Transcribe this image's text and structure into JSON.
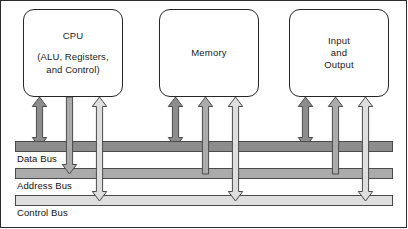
{
  "diagram": {
    "frame": {
      "width": 408,
      "height": 229
    }
  },
  "units": [
    {
      "id": "cpu",
      "title": "CPU",
      "subtitle_lines": [
        "(ALU, Registers,",
        "and Control)"
      ],
      "x": 22,
      "y": 8,
      "w": 100,
      "h": 88
    },
    {
      "id": "memory",
      "title": "Memory",
      "subtitle_lines": [],
      "x": 158,
      "y": 8,
      "w": 100,
      "h": 88
    },
    {
      "id": "input-output",
      "title": "Input\nand\nOutput",
      "title_lines": [
        "Input",
        "and",
        "Output"
      ],
      "subtitle_lines": [],
      "x": 288,
      "y": 8,
      "w": 100,
      "h": 88
    }
  ],
  "buses": [
    {
      "id": "data-bus",
      "label": "Data Bus",
      "x": 14,
      "y": 140,
      "w": 378,
      "h": 11,
      "color": "#8d8d8d",
      "label_x": 16,
      "label_y": 152
    },
    {
      "id": "address-bus",
      "label": "Address Bus",
      "x": 14,
      "y": 167,
      "w": 378,
      "h": 11,
      "color": "#ababab",
      "label_x": 16,
      "label_y": 179
    },
    {
      "id": "control-bus",
      "label": "Control Bus",
      "x": 14,
      "y": 194,
      "w": 378,
      "h": 11,
      "color": "#dedede",
      "label_x": 16,
      "label_y": 206
    }
  ],
  "colors": {
    "arrow_dark": "#8d8d8d",
    "arrow_mid": "#ababab",
    "arrow_light": "#dedede",
    "outline": "#4a4a4a",
    "box_border": "#262626",
    "text": "#1a1a1a",
    "background": "#ffffff"
  },
  "connections": [
    {
      "unit": "cpu",
      "bus": "data-bus",
      "style": "double",
      "shade": "dark",
      "x": 38,
      "top": 96,
      "bottom": 146
    },
    {
      "unit": "cpu",
      "bus": "address-bus",
      "style": "down",
      "shade": "mid",
      "x": 68,
      "top": 96,
      "bottom": 173
    },
    {
      "unit": "cpu",
      "bus": "control-bus",
      "style": "double",
      "shade": "light",
      "x": 98,
      "top": 96,
      "bottom": 200
    },
    {
      "unit": "memory",
      "bus": "data-bus",
      "style": "double",
      "shade": "dark",
      "x": 174,
      "top": 96,
      "bottom": 146
    },
    {
      "unit": "memory",
      "bus": "address-bus",
      "style": "up",
      "shade": "mid",
      "x": 204,
      "top": 96,
      "bottom": 173
    },
    {
      "unit": "memory",
      "bus": "control-bus",
      "style": "double",
      "shade": "light",
      "x": 234,
      "top": 96,
      "bottom": 200
    },
    {
      "unit": "input-output",
      "bus": "data-bus",
      "style": "double",
      "shade": "dark",
      "x": 304,
      "top": 96,
      "bottom": 146
    },
    {
      "unit": "input-output",
      "bus": "address-bus",
      "style": "up",
      "shade": "mid",
      "x": 334,
      "top": 96,
      "bottom": 173
    },
    {
      "unit": "input-output",
      "bus": "control-bus",
      "style": "double",
      "shade": "light",
      "x": 364,
      "top": 96,
      "bottom": 200
    }
  ]
}
